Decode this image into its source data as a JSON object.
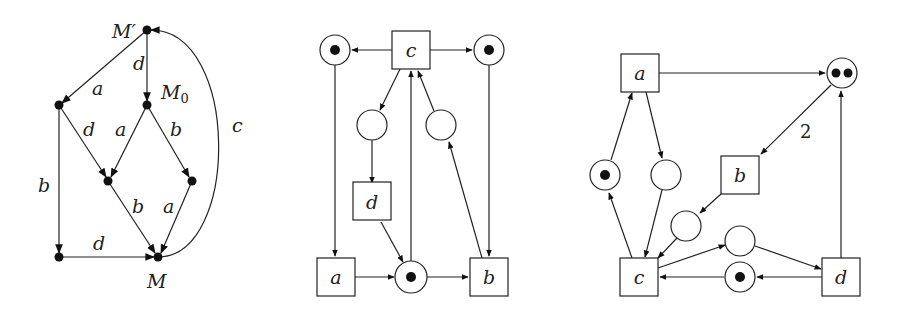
{
  "figures": [
    {
      "id": "reachability-graph",
      "nodes": [
        {
          "id": "Mp",
          "x": 147,
          "y": 30,
          "label": "M′",
          "lx": 112,
          "ly": 38
        },
        {
          "id": "M0",
          "x": 147,
          "y": 105,
          "label": "M0",
          "lx": 162,
          "ly": 92
        },
        {
          "id": "L",
          "x": 59,
          "y": 105
        },
        {
          "id": "C",
          "x": 108,
          "y": 181
        },
        {
          "id": "R",
          "x": 192,
          "y": 181
        },
        {
          "id": "BL",
          "x": 59,
          "y": 257
        },
        {
          "id": "M",
          "x": 158,
          "y": 257,
          "label": "M",
          "lx": 148,
          "ly": 290
        }
      ],
      "edges": [
        {
          "from": "Mp",
          "to": "L",
          "label": "a",
          "lx": 92,
          "ly": 90
        },
        {
          "from": "Mp",
          "to": "M0",
          "label": "d",
          "lx": 133,
          "ly": 70
        },
        {
          "from": "L",
          "to": "C",
          "label": "d",
          "lx": 84,
          "ly": 135
        },
        {
          "from": "M0",
          "to": "C",
          "label": "a",
          "lx": 116,
          "ly": 135
        },
        {
          "from": "M0",
          "to": "R",
          "label": "b",
          "lx": 171,
          "ly": 135
        },
        {
          "from": "L",
          "to": "BL",
          "label": "b",
          "lx": 38,
          "ly": 190
        },
        {
          "from": "C",
          "to": "M",
          "label": "b",
          "lx": 131,
          "ly": 210
        },
        {
          "from": "R",
          "to": "M",
          "label": "a",
          "lx": 163,
          "ly": 210
        },
        {
          "from": "BL",
          "to": "M",
          "label": "d",
          "lx": 93,
          "ly": 250
        }
      ],
      "arc": {
        "from": "M",
        "to": "Mp",
        "label": "c",
        "lx": 232,
        "ly": 132
      }
    },
    {
      "id": "petri-net-1",
      "transitions": [
        {
          "id": "c",
          "label": "c",
          "x": 411,
          "y": 50
        },
        {
          "id": "d",
          "label": "d",
          "x": 372,
          "y": 204
        },
        {
          "id": "a",
          "label": "a",
          "x": 336,
          "y": 277
        },
        {
          "id": "b",
          "label": "b",
          "x": 489,
          "y": 277
        }
      ],
      "places": [
        {
          "id": "p1",
          "x": 335,
          "y": 50,
          "tokens": 1
        },
        {
          "id": "p2",
          "x": 489,
          "y": 50,
          "tokens": 1
        },
        {
          "id": "p3",
          "x": 372,
          "y": 125,
          "tokens": 0
        },
        {
          "id": "p4",
          "x": 441,
          "y": 125,
          "tokens": 0
        },
        {
          "id": "p5",
          "x": 411,
          "y": 277,
          "tokens": 1
        }
      ]
    },
    {
      "id": "petri-net-2",
      "transitions": [
        {
          "id": "a",
          "label": "a",
          "x": 640,
          "y": 73
        },
        {
          "id": "b",
          "label": "b",
          "x": 740,
          "y": 175
        },
        {
          "id": "c",
          "label": "c",
          "x": 639,
          "y": 277
        },
        {
          "id": "d",
          "label": "d",
          "x": 841,
          "y": 277
        }
      ],
      "places": [
        {
          "id": "q1",
          "x": 842,
          "y": 73,
          "tokens": 2
        },
        {
          "id": "q2",
          "x": 605,
          "y": 175,
          "tokens": 1
        },
        {
          "id": "q3",
          "x": 666,
          "y": 175,
          "tokens": 0
        },
        {
          "id": "q4",
          "x": 686,
          "y": 226,
          "tokens": 0
        },
        {
          "id": "q5",
          "x": 740,
          "y": 241,
          "tokens": 0
        },
        {
          "id": "q6",
          "x": 740,
          "y": 277,
          "tokens": 1
        }
      ],
      "arc_weight_label": "2"
    }
  ]
}
